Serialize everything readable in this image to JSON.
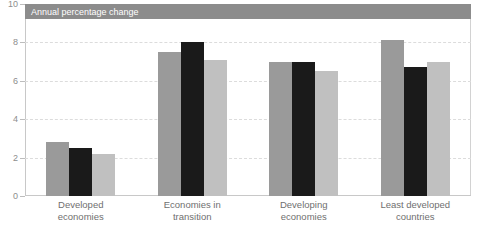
{
  "banner": {
    "text": "Annual percentage change",
    "background_color": "#8c8c8c",
    "text_color": "#ffffff"
  },
  "chart_data": {
    "type": "bar",
    "title": "Annual percentage change",
    "xlabel": "",
    "ylabel": "",
    "ylim": [
      0,
      10
    ],
    "yticks": [
      0,
      2,
      4,
      6,
      8,
      10
    ],
    "grid": true,
    "legend": "none",
    "categories": [
      "Developed economies",
      "Economies in transition",
      "Developing economies",
      "Least developed countries"
    ],
    "category_lines": [
      [
        "Developed",
        "economies"
      ],
      [
        "Economies in",
        "transition"
      ],
      [
        "Developing",
        "economies"
      ],
      [
        "Least developed",
        "countries"
      ]
    ],
    "series": [
      {
        "name": "series-1",
        "color": "#9a9a9a",
        "values": [
          2.8,
          7.5,
          7.0,
          8.1
        ]
      },
      {
        "name": "series-2",
        "color": "#1a1a1a",
        "values": [
          2.5,
          8.0,
          7.0,
          6.7
        ]
      },
      {
        "name": "series-3",
        "color": "#c0c0c0",
        "values": [
          2.2,
          7.1,
          6.5,
          7.0
        ]
      }
    ]
  },
  "axis": {
    "tick_labels": [
      "10",
      "8",
      "6",
      "4",
      "2",
      "0"
    ],
    "tick_color": "#8d8d8d"
  }
}
